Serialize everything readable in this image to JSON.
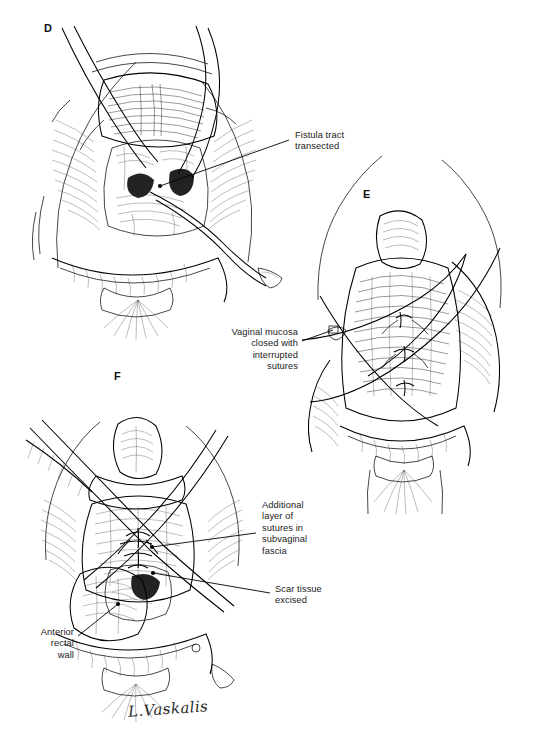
{
  "figure": {
    "kind": "surgical-line-illustration",
    "background_color": "#ffffff",
    "ink_color": "#000000",
    "signature": "L.Vaskalis"
  },
  "panels": [
    {
      "letter": "D",
      "x": 44,
      "y": 22,
      "caption": "Fistula tract transected with scissors; retractors expose the vaginal field"
    },
    {
      "letter": "E",
      "x": 363,
      "y": 188,
      "caption": "Vaginal mucosa closed with interrupted sutures"
    },
    {
      "letter": "F",
      "x": 114,
      "y": 370,
      "caption": "Additional layer of sutures placed in subvaginal fascia after scar excision"
    }
  ],
  "annotations": [
    {
      "id": "fistula-tract-transected",
      "text": "Fistula tract\ntransected",
      "align": "left",
      "x": 295,
      "y": 130,
      "panel": "D",
      "leader": {
        "x1": 289,
        "y1": 140,
        "x2": 160,
        "y2": 186,
        "dot_x": 160,
        "dot_y": 186
      }
    },
    {
      "id": "vaginal-mucosa-closed",
      "text": "Vaginal mucosa\nclosed with\ninterrupted\nsutures",
      "align": "right",
      "x": 190,
      "y": 327,
      "width": 108,
      "panel": "E",
      "leader": {
        "x1": 302,
        "y1": 341,
        "x2": 333,
        "y2": 330,
        "dot_x": 333,
        "dot_y": 330
      }
    },
    {
      "id": "additional-layer-sutures",
      "text": "Additional\nlayer of\nsutures in\nsubvaginal\nfascia",
      "align": "left",
      "x": 262,
      "y": 500,
      "panel": "F",
      "leader": {
        "x1": 256,
        "y1": 533,
        "x2": 152,
        "y2": 547,
        "dot_x": 152,
        "dot_y": 547
      }
    },
    {
      "id": "scar-tissue-excised",
      "text": "Scar tissue\nexcised",
      "align": "left",
      "x": 275,
      "y": 584,
      "panel": "F",
      "leader": {
        "x1": 270,
        "y1": 593,
        "x2": 153,
        "y2": 573,
        "dot_x": 153,
        "dot_y": 573
      }
    },
    {
      "id": "anterior-rectal-wall",
      "text": "Anterior\nrectal\nwall",
      "align": "right",
      "x": 12,
      "y": 627,
      "width": 62,
      "panel": "F",
      "leader": {
        "x1": 78,
        "y1": 636,
        "x2": 118,
        "y2": 604,
        "dot_x": 118,
        "dot_y": 604
      }
    }
  ]
}
